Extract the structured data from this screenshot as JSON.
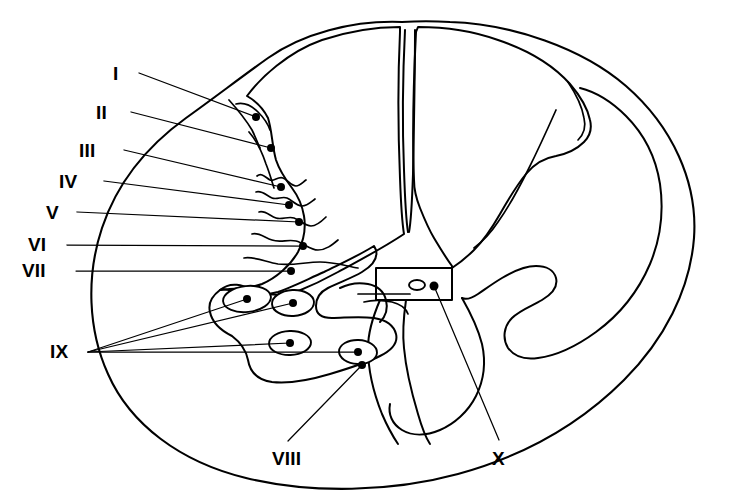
{
  "figure": {
    "background_color": "#ffffff",
    "line_color": "#000000",
    "width": 731,
    "height": 503
  },
  "labels": [
    {
      "id": "lamina-1",
      "text": "I",
      "x": 113,
      "y": 64,
      "anchor_x": 256,
      "anchor_y": 117
    },
    {
      "id": "lamina-2",
      "text": "II",
      "x": 96,
      "y": 103,
      "anchor_x": 271,
      "anchor_y": 148
    },
    {
      "id": "lamina-3",
      "text": "III",
      "x": 79,
      "y": 141,
      "anchor_x": 281,
      "anchor_y": 187
    },
    {
      "id": "lamina-4",
      "text": "IV",
      "x": 59,
      "y": 172,
      "anchor_x": 289,
      "anchor_y": 205
    },
    {
      "id": "lamina-5",
      "text": "V",
      "x": 46,
      "y": 203,
      "anchor_x": 299,
      "anchor_y": 222
    },
    {
      "id": "lamina-6",
      "text": "VI",
      "x": 28,
      "y": 235,
      "anchor_x": 303,
      "anchor_y": 246
    },
    {
      "id": "lamina-7",
      "text": "VII",
      "x": 22,
      "y": 261,
      "anchor_x": 291,
      "anchor_y": 271
    },
    {
      "id": "lamina-9",
      "text": "IX",
      "x": 50,
      "y": 342,
      "anchor_x": 88,
      "anchor_y": 352
    },
    {
      "id": "lamina-8",
      "text": "VIII",
      "x": 272,
      "y": 449,
      "anchor_x": 362,
      "anchor_y": 365
    },
    {
      "id": "lamina-10",
      "text": "X",
      "x": 492,
      "y": 449,
      "anchor_x": 434,
      "anchor_y": 286
    }
  ],
  "leaders": [
    {
      "id": "leader-1",
      "label": "I",
      "path": "M 139 73 L 256 117"
    },
    {
      "id": "leader-2",
      "label": "II",
      "path": "M 131 112 L 271 148"
    },
    {
      "id": "leader-3",
      "label": "III",
      "path": "M 124 150 L 281 187"
    },
    {
      "id": "leader-4",
      "label": "IV",
      "path": "M 104 181 L 289 205"
    },
    {
      "id": "leader-5",
      "label": "V",
      "path": "M 77 212 L 299 222"
    },
    {
      "id": "leader-6",
      "label": "VI",
      "path": "M 67 245 L 303 246"
    },
    {
      "id": "leader-7",
      "label": "VII",
      "path": "M 76 271 L 291 271"
    },
    {
      "id": "leader-9a",
      "label": "IX",
      "path": "M 88 352 L 247 299"
    },
    {
      "id": "leader-9b",
      "label": "IX",
      "path": "M 88 352 L 293 303"
    },
    {
      "id": "leader-9c",
      "label": "IX",
      "path": "M 88 352 L 290 343"
    },
    {
      "id": "leader-9d",
      "label": "IX",
      "path": "M 88 352 L 358 352"
    },
    {
      "id": "leader-8",
      "label": "VIII",
      "path": "M 288 441 L 362 365"
    },
    {
      "id": "leader-10",
      "label": "X",
      "path": "M 499 440 L 434 286"
    }
  ],
  "motor_nuclei": [
    {
      "id": "nucleus-1",
      "cx": 247,
      "cy": 299,
      "rx": 24,
      "ry": 13,
      "rot": -6
    },
    {
      "id": "nucleus-2",
      "cx": 293,
      "cy": 303,
      "rx": 21,
      "ry": 13,
      "rot": -3
    },
    {
      "id": "nucleus-3",
      "cx": 290,
      "cy": 343,
      "rx": 21,
      "ry": 12,
      "rot": -2
    },
    {
      "id": "nucleus-4",
      "cx": 358,
      "cy": 352,
      "rx": 19,
      "ry": 12,
      "rot": 2
    }
  ],
  "central_canal": {
    "id": "central-canal",
    "cx": 417,
    "cy": 285,
    "rx": 8,
    "ry": 5
  }
}
